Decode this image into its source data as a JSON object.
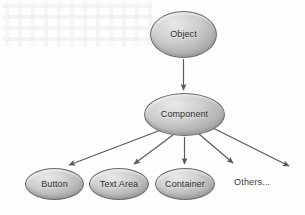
{
  "diagram": {
    "type": "tree",
    "background_color": "#fefefe",
    "node_fill_light": "#e8e8e8",
    "node_fill_dark": "#ababab",
    "node_border_color": "#6b6b6b",
    "arrow_color": "#595959",
    "text_color": "#2a2a2a",
    "nodes": [
      {
        "id": "object",
        "label": "Object",
        "shape": "ellipse",
        "level": 0
      },
      {
        "id": "component",
        "label": "Component",
        "shape": "ellipse",
        "level": 1
      },
      {
        "id": "button",
        "label": "Button",
        "shape": "ellipse",
        "level": 2
      },
      {
        "id": "textarea",
        "label": "Text Area",
        "shape": "ellipse",
        "level": 2
      },
      {
        "id": "container",
        "label": "Container",
        "shape": "ellipse",
        "level": 2
      },
      {
        "id": "others",
        "label": "Others...",
        "shape": "text",
        "level": 2
      }
    ],
    "edges": [
      {
        "from": "object",
        "to": "component",
        "style": "arrow"
      },
      {
        "from": "component",
        "to": "button",
        "style": "arrow"
      },
      {
        "from": "component",
        "to": "textarea",
        "style": "arrow"
      },
      {
        "from": "component",
        "to": "container",
        "style": "arrow"
      },
      {
        "from": "component",
        "to": "others",
        "style": "arrow"
      },
      {
        "from": "component",
        "to": "unlabeled-right",
        "style": "arrow"
      }
    ]
  }
}
